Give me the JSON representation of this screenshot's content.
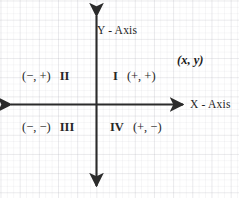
{
  "diagram": {
    "background_color": "#ffffff",
    "grid_color": "#e9e9ed",
    "axis_color": "#2b2b2b",
    "text_color": "#262626"
  },
  "axes": {
    "y_label": "Y - Axis",
    "x_label": "X - Axis",
    "origin": {
      "x": 96,
      "y": 104
    }
  },
  "point": {
    "label": "(x, y)"
  },
  "quadrants": [
    {
      "roman": "I",
      "signs": "(+, +)",
      "order": "roman-last",
      "name": "quadrant-1"
    },
    {
      "roman": "II",
      "signs": "(−, +)",
      "order": "roman-last",
      "name": "quadrant-2"
    },
    {
      "roman": "III",
      "signs": "(−, −)",
      "order": "roman-last",
      "name": "quadrant-3"
    },
    {
      "roman": "IV",
      "signs": "(+, −)",
      "order": "roman-first",
      "name": "quadrant-4"
    }
  ],
  "labels": {
    "q1_roman": "I",
    "q1_signs": "(+, +)",
    "q2_signs": "(−, +)",
    "q2_roman": "II",
    "q3_signs": "(−, −)",
    "q3_roman": "III",
    "q4_roman": "IV",
    "q4_signs": "(+, −)"
  }
}
